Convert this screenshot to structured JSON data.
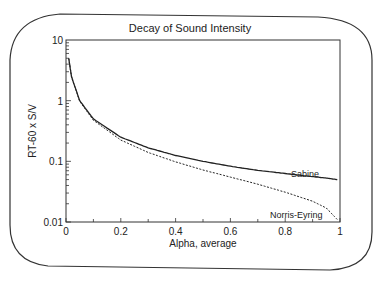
{
  "chart_data": {
    "type": "line",
    "title": "Decay of Sound Intensity",
    "xlabel": "Alpha, average",
    "ylabel": "RT-60 x S/V",
    "xlim": [
      0,
      1
    ],
    "ylim": [
      0.01,
      10
    ],
    "yscale": "log",
    "grid": false,
    "legend": "inline labels near curve ends",
    "x_ticks": [
      "0",
      "0.2",
      "0.4",
      "0.6",
      "0.8",
      "1"
    ],
    "y_ticks": [
      "0.01",
      "0.1",
      "1",
      "10"
    ],
    "x": [
      0.01,
      0.02,
      0.05,
      0.1,
      0.2,
      0.3,
      0.4,
      0.5,
      0.6,
      0.7,
      0.8,
      0.9,
      0.95,
      0.99
    ],
    "series": [
      {
        "name": "Sabine",
        "style": "solid",
        "values": [
          5.0,
          2.5,
          1.0,
          0.5,
          0.25,
          0.167,
          0.125,
          0.1,
          0.083,
          0.071,
          0.063,
          0.056,
          0.053,
          0.05
        ]
      },
      {
        "name": "Norris-Eyring",
        "style": "dashed",
        "values": [
          4.98,
          2.47,
          0.975,
          0.475,
          0.224,
          0.14,
          0.098,
          0.072,
          0.055,
          0.042,
          0.031,
          0.022,
          0.017,
          0.011
        ]
      }
    ]
  }
}
